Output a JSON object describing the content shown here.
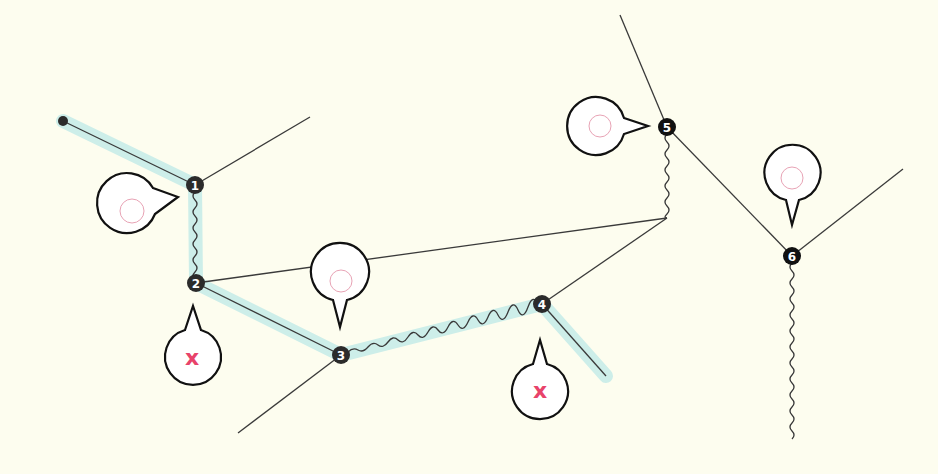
{
  "colors": {
    "background": "#fdfdef",
    "highlight": "#cdeee9",
    "line": "#3a3a3a",
    "node": "#2b2b2b",
    "bubble_fill": "#ffffff",
    "bubble_stroke": "#111111",
    "ring": "#e8a3b5",
    "cross": "#e8436a"
  },
  "nodes": [
    {
      "id": "1",
      "label": "1",
      "x": 195,
      "y": 185
    },
    {
      "id": "2",
      "label": "2",
      "x": 196,
      "y": 283
    },
    {
      "id": "3",
      "label": "3",
      "x": 341,
      "y": 355
    },
    {
      "id": "4",
      "label": "4",
      "x": 542,
      "y": 304
    },
    {
      "id": "5",
      "label": "5",
      "x": 667,
      "y": 127
    },
    {
      "id": "6",
      "label": "6",
      "x": 792,
      "y": 256
    }
  ],
  "callouts": [
    {
      "node": "1",
      "type": "ring",
      "icon": "ring-icon"
    },
    {
      "node": "2",
      "type": "cross",
      "icon": "cross-icon",
      "label": "x"
    },
    {
      "node": "3",
      "type": "ring",
      "icon": "ring-icon"
    },
    {
      "node": "4",
      "type": "cross",
      "icon": "cross-icon",
      "label": "x"
    },
    {
      "node": "5",
      "type": "ring",
      "icon": "ring-icon"
    },
    {
      "node": "6",
      "type": "ring",
      "icon": "ring-icon"
    }
  ]
}
